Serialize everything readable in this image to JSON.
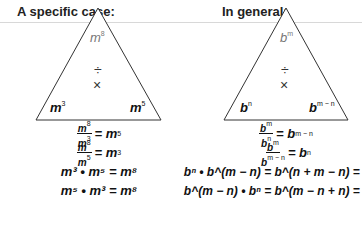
{
  "specific": {
    "heading": "A specific case:",
    "top": "m",
    "top_exp": "8",
    "divide": "÷",
    "times": "×",
    "left": "m",
    "left_exp": "3",
    "right": "m",
    "right_exp": "5",
    "equations": [
      {
        "num": "m",
        "num_exp": "8",
        "den": "m",
        "den_exp": "3",
        "eq": "= m",
        "res_exp": "5"
      },
      {
        "num": "m",
        "num_exp": "8",
        "den": "m",
        "den_exp": "5",
        "eq": "= m",
        "res_exp": "3"
      },
      {
        "text": "m³ • m⁵ = m⁸"
      },
      {
        "text": "m⁵ • m³ = m⁸"
      }
    ]
  },
  "general": {
    "heading": "In general:",
    "top": "b",
    "top_exp": "m",
    "divide": "÷",
    "times": "×",
    "left": "b",
    "left_exp": "n",
    "right": "b",
    "right_exp": "m − n",
    "equations": [
      {
        "num": "b",
        "num_exp": "m",
        "den": "b",
        "den_exp": "n",
        "eq": "= b",
        "res_exp": "m − n"
      },
      {
        "num": "b",
        "num_exp": "m",
        "den": "b",
        "den_exp": "m − n",
        "eq": "= b",
        "res_exp": "n"
      },
      {
        "text": "bⁿ • b^(m − n) = b^(n + m − n) = b^m"
      },
      {
        "text": "b^(m − n) • bⁿ = b^(m − n + n) = b^m"
      }
    ]
  }
}
